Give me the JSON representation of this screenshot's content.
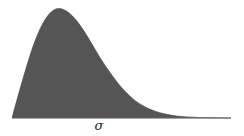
{
  "chart_data": {
    "type": "area",
    "title": "",
    "xlabel": "σ",
    "ylabel": "",
    "x": [
      0,
      0.5,
      1,
      1.5,
      2,
      2.5,
      3,
      3.5,
      4,
      4.5,
      5,
      5.5,
      6,
      6.5,
      7,
      7.5,
      8,
      8.5,
      9,
      9.5,
      10
    ],
    "values": [
      0.0,
      0.36,
      0.68,
      0.9,
      1.0,
      0.98,
      0.88,
      0.73,
      0.56,
      0.41,
      0.28,
      0.18,
      0.11,
      0.065,
      0.036,
      0.019,
      0.01,
      0.005,
      0.002,
      0.001,
      0.0
    ],
    "grid": false,
    "legend": null,
    "fill_color": "#555555"
  },
  "labels": {
    "x_axis": "σ"
  }
}
